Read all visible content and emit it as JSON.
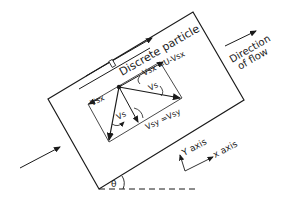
{
  "diagram": {
    "type": "inclined settling tank particle velocity diagram",
    "labels": {
      "discrete_particle": "Discrete particle",
      "vsx_eq": "Vsx =U-Vsx",
      "vsx_prime": "Vsx",
      "vs_prime": "Vs",
      "vs": "Vs",
      "vsx": "Vsx",
      "vsy_eq": "Vsy =Vsy",
      "u": "U",
      "direction_line1": "Direction",
      "direction_line2": "of flow",
      "y_axis": "Y axis",
      "x_axis": "x axis",
      "theta": "θ"
    },
    "colors": {
      "stroke": "#1a1a1a",
      "background": "#ffffff"
    }
  }
}
